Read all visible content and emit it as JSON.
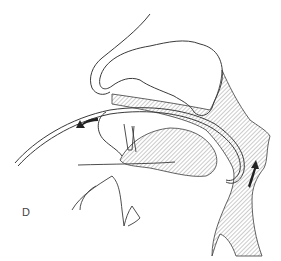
{
  "figure": {
    "panel_label": "D",
    "colors": {
      "line": "#3a3a3a",
      "hatch": "#6a6a6a",
      "arrow": "#222222",
      "background": "#ffffff"
    },
    "arrows": [
      {
        "name": "outward-arrow",
        "direction": "left"
      },
      {
        "name": "upward-arrow",
        "direction": "up"
      }
    ]
  }
}
